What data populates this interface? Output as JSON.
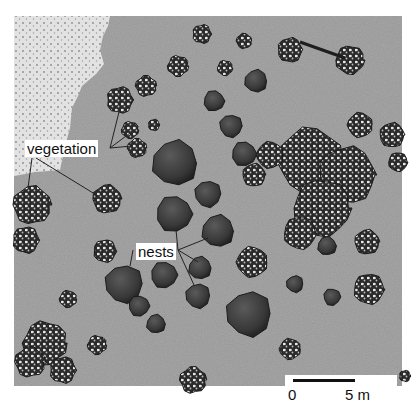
{
  "figure": {
    "type": "illustrated site map",
    "colors": {
      "background": "#ffffff",
      "ground": "#a8a8a8",
      "sand_area": "#d8d8d8",
      "vegetation_dark": "#2a2a2a",
      "vegetation_light": "#e8e8e8",
      "nest": "#3c3c3c",
      "label_bg": "#ffffff",
      "leader_line": "#222222"
    },
    "labels": {
      "vegetation": "vegetation",
      "nests": "nests"
    },
    "scale_bar": {
      "start_label": "0",
      "end_label": "5 m"
    },
    "nests": [
      {
        "x": 214,
        "y": 101,
        "r": 11
      },
      {
        "x": 256,
        "y": 81,
        "r": 12
      },
      {
        "x": 231,
        "y": 126,
        "r": 12
      },
      {
        "x": 244,
        "y": 154,
        "r": 13
      },
      {
        "x": 175,
        "y": 163,
        "r": 24
      },
      {
        "x": 208,
        "y": 194,
        "r": 14
      },
      {
        "x": 174,
        "y": 214,
        "r": 19
      },
      {
        "x": 218,
        "y": 231,
        "r": 17
      },
      {
        "x": 124,
        "y": 284,
        "r": 20
      },
      {
        "x": 164,
        "y": 275,
        "r": 14
      },
      {
        "x": 200,
        "y": 268,
        "r": 12
      },
      {
        "x": 198,
        "y": 296,
        "r": 13
      },
      {
        "x": 139,
        "y": 306,
        "r": 11
      },
      {
        "x": 156,
        "y": 324,
        "r": 10
      },
      {
        "x": 249,
        "y": 314,
        "r": 24
      },
      {
        "x": 218,
        "y": 218,
        "r": 0
      },
      {
        "x": 327,
        "y": 246,
        "r": 10
      },
      {
        "x": 295,
        "y": 284,
        "r": 9
      },
      {
        "x": 332,
        "y": 297,
        "r": 9
      },
      {
        "x": 310,
        "y": 180,
        "r": 0
      }
    ],
    "vegetation": [
      {
        "x": 202,
        "y": 34,
        "r": 10
      },
      {
        "x": 178,
        "y": 66,
        "r": 11
      },
      {
        "x": 146,
        "y": 86,
        "r": 11
      },
      {
        "x": 120,
        "y": 100,
        "r": 14
      },
      {
        "x": 130,
        "y": 130,
        "r": 9
      },
      {
        "x": 137,
        "y": 148,
        "r": 10
      },
      {
        "x": 154,
        "y": 125,
        "r": 6
      },
      {
        "x": 225,
        "y": 68,
        "r": 8
      },
      {
        "x": 244,
        "y": 41,
        "r": 8
      },
      {
        "x": 290,
        "y": 50,
        "r": 13
      },
      {
        "x": 350,
        "y": 60,
        "r": 15
      },
      {
        "x": 310,
        "y": 160,
        "r": 34
      },
      {
        "x": 347,
        "y": 175,
        "r": 30
      },
      {
        "x": 322,
        "y": 208,
        "r": 30
      },
      {
        "x": 360,
        "y": 125,
        "r": 13
      },
      {
        "x": 392,
        "y": 135,
        "r": 13
      },
      {
        "x": 398,
        "y": 162,
        "r": 10
      },
      {
        "x": 270,
        "y": 155,
        "r": 14
      },
      {
        "x": 254,
        "y": 175,
        "r": 12
      },
      {
        "x": 300,
        "y": 233,
        "r": 17
      },
      {
        "x": 252,
        "y": 262,
        "r": 16
      },
      {
        "x": 367,
        "y": 242,
        "r": 13
      },
      {
        "x": 369,
        "y": 289,
        "r": 16
      },
      {
        "x": 290,
        "y": 349,
        "r": 11
      },
      {
        "x": 107,
        "y": 199,
        "r": 15
      },
      {
        "x": 105,
        "y": 251,
        "r": 12
      },
      {
        "x": 68,
        "y": 299,
        "r": 9
      },
      {
        "x": 32,
        "y": 205,
        "r": 20
      },
      {
        "x": 26,
        "y": 240,
        "r": 14
      },
      {
        "x": 45,
        "y": 343,
        "r": 23
      },
      {
        "x": 30,
        "y": 362,
        "r": 16
      },
      {
        "x": 63,
        "y": 370,
        "r": 14
      },
      {
        "x": 97,
        "y": 345,
        "r": 10
      },
      {
        "x": 193,
        "y": 380,
        "r": 14
      },
      {
        "x": 405,
        "y": 376,
        "r": 6
      }
    ]
  }
}
